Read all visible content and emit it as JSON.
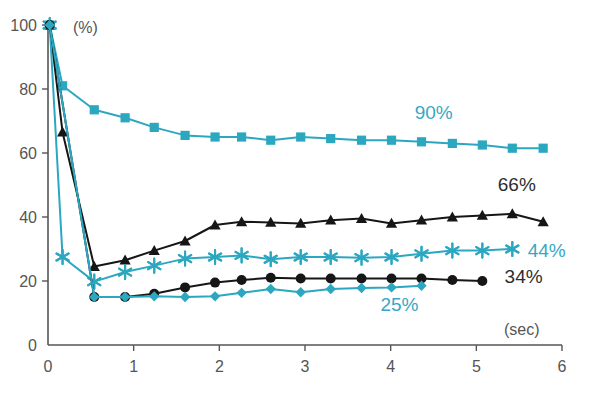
{
  "chart_data": {
    "type": "line",
    "title": "",
    "xlabel": "(sec)",
    "ylabel": "(%)",
    "xlim": [
      0,
      6
    ],
    "ylim": [
      0,
      100
    ],
    "xticks": [
      0,
      1,
      2,
      3,
      4,
      5,
      6
    ],
    "xticklabels": [
      "0",
      "1",
      "2",
      "3",
      "4",
      "5",
      "6"
    ],
    "yticks": [
      0,
      20,
      40,
      60,
      80,
      100
    ],
    "yticklabels": [
      "0",
      "20",
      "40",
      "60",
      "80",
      "100"
    ],
    "grid": false,
    "legend_position": "inline-end-labels",
    "series": [
      {
        "name": "90%",
        "label": "90%",
        "color": "#2ca7c0",
        "marker": "square",
        "label_color": "#37a8c4",
        "label_x": 4.28,
        "label_y": 70.5,
        "x": [
          0.02,
          0.17,
          0.54,
          0.9,
          1.24,
          1.6,
          1.95,
          2.26,
          2.6,
          2.95,
          3.3,
          3.66,
          4.01,
          4.36,
          4.72,
          5.07,
          5.42,
          5.78
        ],
        "y": [
          100,
          81,
          73.5,
          71,
          68,
          65.5,
          65,
          65,
          64,
          65,
          64.5,
          64,
          64,
          63.5,
          63,
          62.5,
          61.5,
          61.5
        ]
      },
      {
        "name": "66%",
        "label": "66%",
        "color": "#161616",
        "marker": "triangle",
        "label_color": "#2e2e2e",
        "label_x": 5.25,
        "label_y": 48,
        "x": [
          0.02,
          0.17,
          0.54,
          0.9,
          1.24,
          1.6,
          1.95,
          2.26,
          2.6,
          2.95,
          3.3,
          3.66,
          4.01,
          4.36,
          4.72,
          5.07,
          5.42,
          5.78
        ],
        "y": [
          100,
          66.5,
          24.5,
          26.5,
          29.5,
          32.5,
          37.5,
          38.5,
          38.3,
          38,
          39,
          39.5,
          38,
          39,
          40,
          40.5,
          41,
          38.5
        ]
      },
      {
        "name": "44%",
        "label": "44%",
        "color": "#2ca7c0",
        "marker": "star",
        "label_color": "#37a8c4",
        "label_x": 5.6,
        "label_y": 27.5,
        "x": [
          0.02,
          0.17,
          0.54,
          0.9,
          1.24,
          1.6,
          1.95,
          2.26,
          2.6,
          2.95,
          3.3,
          3.66,
          4.01,
          4.36,
          4.72,
          5.07,
          5.42
        ],
        "y": [
          100,
          27.5,
          19.8,
          22.8,
          24.8,
          27,
          27.5,
          28,
          26.8,
          27.5,
          27.5,
          27.3,
          27.5,
          28.5,
          29.5,
          29.5,
          30
        ]
      },
      {
        "name": "34%",
        "label": "34%",
        "color": "#161616",
        "marker": "circle",
        "label_color": "#2e2e2e",
        "label_x": 5.33,
        "label_y": 19.5,
        "x": [
          0.02,
          0.54,
          0.9,
          1.24,
          1.6,
          1.95,
          2.26,
          2.6,
          2.95,
          3.3,
          3.66,
          4.01,
          4.36,
          4.72,
          5.07
        ],
        "y": [
          100,
          15,
          15,
          16,
          18,
          19.5,
          20.3,
          21,
          20.8,
          20.8,
          20.8,
          20.8,
          20.8,
          20.3,
          20
        ]
      },
      {
        "name": "25%",
        "label": "25%",
        "color": "#2ca7c0",
        "marker": "diamond",
        "label_color": "#5fc0d4",
        "label_x": 3.88,
        "label_y": 10.5,
        "x": [
          0.02,
          0.54,
          0.9,
          1.24,
          1.6,
          1.95,
          2.26,
          2.6,
          2.95,
          3.3,
          3.66,
          4.01,
          4.36
        ],
        "y": [
          100,
          15,
          15,
          15.2,
          15,
          15.2,
          16.3,
          17.5,
          16.5,
          17.5,
          17.8,
          18,
          18.5
        ]
      }
    ]
  },
  "axes": {
    "y_unit_label": "(%)",
    "x_unit_label": "(sec)"
  },
  "caption": {
    "text": ""
  }
}
